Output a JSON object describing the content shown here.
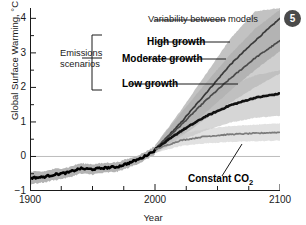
{
  "badge": {
    "label": "5"
  },
  "chart_data": {
    "type": "line",
    "title": "",
    "xlabel": "Year",
    "ylabel": "Global Surface Warming, °C",
    "xlim": [
      1900,
      2100
    ],
    "ylim": [
      -1,
      4.3
    ],
    "grid": false,
    "zero_line": 0,
    "xticks_major": [
      1900,
      2000,
      2100
    ],
    "xticks_major_labels": [
      "1900",
      "2000",
      "2100"
    ],
    "xticks_minor": [
      1925,
      1950,
      1975,
      2025,
      2050,
      2075
    ],
    "yticks_major": [
      -1,
      0,
      1,
      2,
      3,
      4
    ],
    "yticks_major_labels": [
      "−1",
      "0",
      "1",
      "2",
      "3",
      "4"
    ],
    "yticks_minor": [
      -0.5,
      0.5,
      1.5,
      2.5,
      3.5
    ],
    "legend_position": "inline-annotations",
    "series": [
      {
        "name": "Historical",
        "style": "solid-black-thick",
        "band": true,
        "x": [
          1900,
          1910,
          1920,
          1930,
          1940,
          1950,
          1960,
          1970,
          1980,
          1990,
          2000
        ],
        "values": [
          -0.62,
          -0.6,
          -0.52,
          -0.47,
          -0.35,
          -0.37,
          -0.33,
          -0.3,
          -0.18,
          -0.03,
          0.18
        ],
        "band_lo": [
          -0.8,
          -0.76,
          -0.68,
          -0.62,
          -0.5,
          -0.52,
          -0.47,
          -0.44,
          -0.31,
          -0.15,
          0.06
        ],
        "band_hi": [
          -0.44,
          -0.44,
          -0.36,
          -0.32,
          -0.2,
          -0.22,
          -0.19,
          -0.16,
          -0.05,
          0.09,
          0.3
        ]
      },
      {
        "name": "High growth",
        "style": "solid-dark",
        "band": true,
        "x": [
          2000,
          2020,
          2040,
          2060,
          2080,
          2100
        ],
        "values": [
          0.2,
          0.95,
          1.8,
          2.65,
          3.35,
          4.0
        ],
        "band_lo": [
          0.1,
          0.6,
          1.25,
          1.9,
          2.5,
          3.05
        ],
        "band_hi": [
          0.32,
          1.3,
          2.35,
          3.4,
          4.2,
          4.3
        ]
      },
      {
        "name": "Moderate growth",
        "style": "solid-mid",
        "band": true,
        "x": [
          2000,
          2020,
          2040,
          2060,
          2080,
          2100
        ],
        "values": [
          0.2,
          0.88,
          1.6,
          2.25,
          2.85,
          3.35
        ],
        "band_lo": [
          0.1,
          0.55,
          1.08,
          1.55,
          2.0,
          2.4
        ],
        "band_hi": [
          0.32,
          1.22,
          2.1,
          2.95,
          3.7,
          4.25
        ]
      },
      {
        "name": "Low growth",
        "style": "solid-black-thick",
        "band": true,
        "x": [
          2000,
          2020,
          2040,
          2060,
          2080,
          2100
        ],
        "values": [
          0.2,
          0.72,
          1.15,
          1.48,
          1.7,
          1.82
        ],
        "band_lo": [
          0.1,
          0.45,
          0.75,
          0.98,
          1.12,
          1.18
        ],
        "band_hi": [
          0.32,
          1.02,
          1.62,
          2.05,
          2.35,
          2.5
        ]
      },
      {
        "name": "Constant CO2",
        "style": "solid-gray",
        "band": true,
        "x": [
          2000,
          2020,
          2040,
          2060,
          2080,
          2100
        ],
        "values": [
          0.2,
          0.46,
          0.58,
          0.64,
          0.67,
          0.7
        ],
        "band_lo": [
          0.1,
          0.3,
          0.38,
          0.42,
          0.44,
          0.46
        ],
        "band_hi": [
          0.32,
          0.64,
          0.8,
          0.88,
          0.92,
          0.96
        ]
      }
    ],
    "annotations": [
      {
        "id": "variability",
        "text": "Variability between models",
        "bold": false
      },
      {
        "id": "emissions",
        "text": "Emissions\nscenarios",
        "bold": false
      },
      {
        "id": "high",
        "text": "High growth",
        "bold": true
      },
      {
        "id": "moderate",
        "text": "Moderate growth",
        "bold": true
      },
      {
        "id": "low",
        "text": "Low growth",
        "bold": true
      },
      {
        "id": "constant",
        "text": "Constant CO",
        "bold": true,
        "subscript": "2"
      }
    ]
  },
  "annotations_text": {
    "variability": "Variability between models",
    "emissions_line1": "Emissions",
    "emissions_line2": "scenarios",
    "high_growth": "High growth",
    "moderate_growth": "Moderate growth",
    "low_growth": "Low growth",
    "constant_co2": "Constant CO",
    "constant_co2_sub": "2"
  },
  "colors": {
    "axis": "#1a1a1a",
    "historical_line": "#000000",
    "historical_band": "#9a9a9a",
    "high_band": "#8f8f8f",
    "moderate_band": "#a8a8a8",
    "low_band": "#b4b4b4",
    "constant_band": "#c9c9c9",
    "zero_line": "#bdbdbd",
    "badge_bg": "#4a4a4a",
    "badge_text": "#ffffff"
  }
}
